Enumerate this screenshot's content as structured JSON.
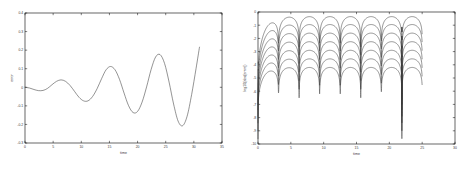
{
  "figure": {
    "background": "#ffffff",
    "curve_color": "#3a3a3a",
    "axis_color": "#000000",
    "panel_count": 2
  },
  "chart_data": [
    {
      "type": "line",
      "panel": "left",
      "title": "",
      "xlabel": "time",
      "ylabel": "error",
      "xlim": [
        0,
        35
      ],
      "ylim": [
        -0.3,
        0.4
      ],
      "xticks": [
        0,
        5,
        10,
        15,
        20,
        25,
        30,
        35
      ],
      "xticklabels": [
        "0",
        "5",
        "10",
        "15",
        "20",
        "25",
        "30",
        "35"
      ],
      "yticks": [
        -0.3,
        -0.2,
        -0.1,
        0,
        0.1,
        0.2,
        0.3,
        0.4
      ],
      "yticklabels": [
        "-0.3",
        "-0.2",
        "-0.1",
        "0",
        "0.1",
        "0.2",
        "0.3",
        "0.4"
      ],
      "grid": false,
      "legend": false,
      "series": [
        {
          "name": "error",
          "description": "growing-amplitude oscillation, amplitude envelope increases roughly linearly with time, period about 6.3 time units, data ends at t=31",
          "x": [
            0,
            0.8,
            1.6,
            2.4,
            3.2,
            4.0,
            4.8,
            5.6,
            6.4,
            7.2,
            8.0,
            8.8,
            9.6,
            10.4,
            11.2,
            12.0,
            12.8,
            13.6,
            14.4,
            15.2,
            16.0,
            16.8,
            17.6,
            18.4,
            19.2,
            20.0,
            20.8,
            21.6,
            22.4,
            23.2,
            24.0,
            24.8,
            25.6,
            26.4,
            27.2,
            28.0,
            28.8,
            29.6,
            30.4,
            31.0
          ],
          "y": [
            0.0,
            -0.004,
            -0.012,
            -0.018,
            -0.017,
            -0.006,
            0.014,
            0.032,
            0.04,
            0.032,
            0.01,
            -0.022,
            -0.054,
            -0.073,
            -0.073,
            -0.05,
            -0.008,
            0.046,
            0.094,
            0.112,
            0.094,
            0.042,
            -0.031,
            -0.099,
            -0.136,
            -0.13,
            -0.08,
            0.002,
            0.095,
            0.163,
            0.176,
            0.128,
            0.028,
            -0.09,
            -0.182,
            -0.207,
            -0.156,
            -0.04,
            0.103,
            0.216
          ]
        }
      ]
    },
    {
      "type": "line",
      "panel": "right",
      "title": "",
      "xlabel": "time",
      "ylabel": "log10(abs(error))",
      "xlim": [
        0,
        30
      ],
      "ylim": [
        -10,
        0
      ],
      "xticks": [
        0,
        5,
        10,
        15,
        20,
        25,
        30
      ],
      "xticklabels": [
        "0",
        "5",
        "10",
        "15",
        "20",
        "25",
        "30"
      ],
      "yticks": [
        -10,
        -9,
        -8,
        -7,
        -6,
        -5,
        -4,
        -3,
        -2,
        -1,
        0
      ],
      "yticklabels": [
        "-10",
        "-9",
        "-8",
        "-7",
        "-6",
        "-5",
        "-4",
        "-3",
        "-2",
        "-1",
        "0"
      ],
      "grid": false,
      "legend": false,
      "series_count": 7,
      "series": [
        {
          "name": "curve-1",
          "plateau": -0.35,
          "start_level": -2.9,
          "trough": -9.6,
          "data_end": 25
        },
        {
          "name": "curve-2",
          "plateau": -0.95,
          "start_level": -3.4,
          "trough": -9.0,
          "data_end": 25
        },
        {
          "name": "curve-3",
          "plateau": -1.6,
          "start_level": -3.9,
          "trough": -8.4,
          "data_end": 25
        },
        {
          "name": "curve-4",
          "plateau": -2.25,
          "start_level": -4.3,
          "trough": -7.9,
          "data_end": 25
        },
        {
          "name": "curve-5",
          "plateau": -2.9,
          "start_level": -4.7,
          "trough": -7.4,
          "data_end": 25
        },
        {
          "name": "curve-6",
          "plateau": -3.55,
          "start_level": -5.1,
          "trough": -7.0,
          "data_end": 25
        },
        {
          "name": "curve-7",
          "plateau": -4.2,
          "start_level": -5.5,
          "trough": -6.6,
          "data_end": 25
        }
      ],
      "description": "seven nested arch-shaped log-error curves, each rising steeply from the left edge to a flat plateau then dipping in sharp narrow cusps at regular intervals of about 3.1 time units; cusp depth greatest for the outermost curve"
    }
  ]
}
